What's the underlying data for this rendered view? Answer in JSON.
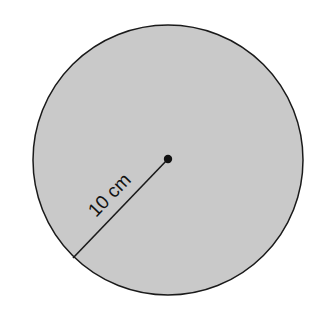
{
  "diagram": {
    "shape": "circle",
    "center": {
      "x": 168,
      "y": 159
    },
    "radius_px": 135,
    "fill_color": "#c9c9c9",
    "stroke_color": "#1a1a1a",
    "center_dot_color": "#111111",
    "radius_line": {
      "x1": 168,
      "y1": 159,
      "x2": 73,
      "y2": 258
    },
    "radius_label": "10 cm"
  }
}
